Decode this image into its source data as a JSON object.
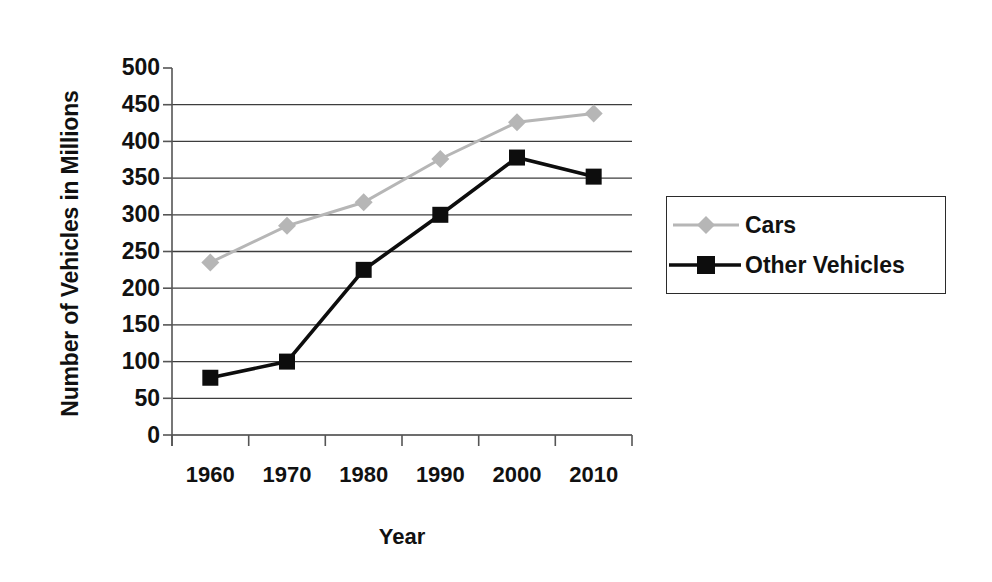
{
  "chart_data": {
    "type": "line",
    "title": "",
    "xlabel": "Year",
    "ylabel": "Number of Vehicles in Millions",
    "categories": [
      "1960",
      "1970",
      "1980",
      "1990",
      "2000",
      "2010"
    ],
    "ylim": [
      0,
      500
    ],
    "ytick_step": 50,
    "yticks": [
      "500",
      "450",
      "400",
      "350",
      "300",
      "250",
      "200",
      "150",
      "100",
      "50",
      "0"
    ],
    "grid": "horizontal",
    "legend_position": "right",
    "series": [
      {
        "name": "Cars",
        "color": "#b6b6b6",
        "marker": "diamond",
        "values": [
          235,
          285,
          317,
          376,
          426,
          438
        ]
      },
      {
        "name": "Other Vehicles",
        "color": "#0d0d0d",
        "marker": "square",
        "values": [
          78,
          100,
          225,
          300,
          378,
          352
        ]
      }
    ]
  },
  "axes": {
    "y_title": "Number of Vehicles in Millions",
    "x_title": "Year"
  },
  "legend": {
    "entries": [
      {
        "label": "Cars"
      },
      {
        "label": "Other Vehicles"
      }
    ]
  },
  "colors": {
    "cars": "#b6b6b6",
    "other_vehicles": "#0d0d0d",
    "gridline": "#3d3d3d",
    "axis": "#555555",
    "text": "#111111",
    "background": "#ffffff"
  }
}
